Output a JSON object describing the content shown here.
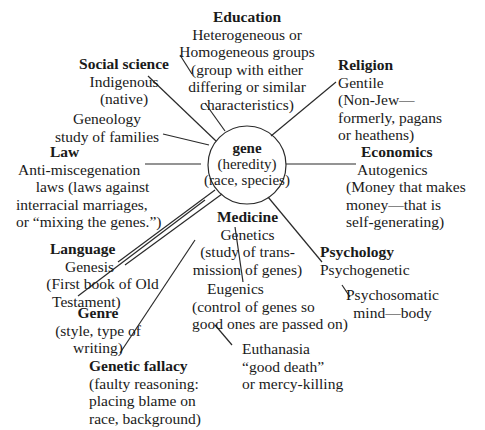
{
  "center": {
    "title": "gene",
    "lines": [
      "(heredity)",
      "(race, species)"
    ]
  },
  "nodes": {
    "education": {
      "heading": "Education",
      "lines": [
        "Heterogeneous or",
        "Homogeneous groups",
        "(group with either",
        "differing or similar",
        "characteristics)"
      ]
    },
    "social_science": {
      "heading": "Social science",
      "lines": [
        "Indigenous",
        "(native)"
      ]
    },
    "religion": {
      "heading": "Religion",
      "lines": [
        "Gentile",
        "(Non-Jew—",
        "formerly, pagans",
        "or heathens)"
      ]
    },
    "geneology": {
      "heading": "",
      "lines": [
        "Geneology",
        "study of families"
      ]
    },
    "law": {
      "heading": "Law",
      "lines": [
        "Anti-miscegenation",
        "laws (laws against",
        "interracial marriages,",
        "or “mixing the genes.”)"
      ]
    },
    "economics": {
      "heading": "Economics",
      "lines": [
        "Autogenics",
        "(Money that makes",
        "money—that is",
        "self-generating)"
      ]
    },
    "language": {
      "heading": "Language",
      "lines": [
        "Genesis",
        "(First book of Old",
        "Testament)"
      ]
    },
    "medicine": {
      "heading": "Medicine",
      "lines": [
        "Genetics",
        "(study of trans-",
        "mission of genes)"
      ]
    },
    "psychology": {
      "heading": "Psychology",
      "lines": [
        "Psychogenetic"
      ]
    },
    "psychosomatic": {
      "lines": [
        "Psychosomatic",
        "mind—body"
      ]
    },
    "eugenics": {
      "lines": [
        "Eugenics",
        "(control of genes so",
        "good ones are passed on)"
      ]
    },
    "genre": {
      "lines": [
        "Genre",
        "(style, type of",
        "writing)"
      ]
    },
    "euthanasia": {
      "lines": [
        "Euthanasia",
        "“good death”",
        "or mercy-killing"
      ]
    },
    "genetic_fallacy": {
      "lines": [
        "Genetic fallacy",
        "(faulty reasoning:",
        "placing blame on",
        "race, background)"
      ]
    }
  },
  "colors": {
    "text": "#1a1a1a",
    "lines": "#2a2a2a",
    "background": "#ffffff"
  }
}
